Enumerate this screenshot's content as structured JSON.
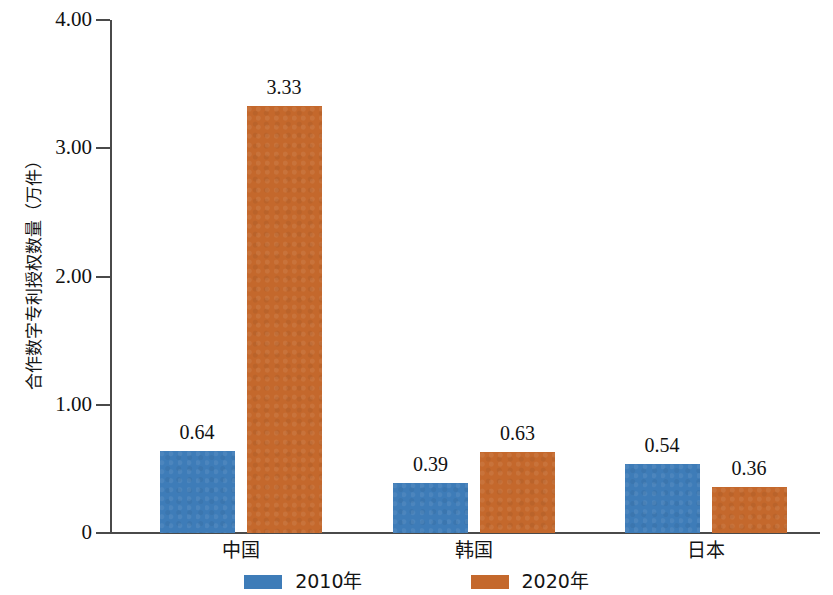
{
  "chart_data": {
    "type": "bar",
    "title": "",
    "subtitle": "",
    "xlabel": "",
    "ylabel": "合作数字专利授权数量（万件）",
    "categories": [
      "中国",
      "韩国",
      "日本"
    ],
    "series": [
      {
        "name": "2010年",
        "color": "#3E7CB8",
        "values": [
          0.64,
          0.39,
          0.54
        ]
      },
      {
        "name": "2020年",
        "color": "#C4682C",
        "values": [
          3.33,
          0.63,
          0.36
        ]
      }
    ],
    "value_labels": [
      [
        "0.64",
        "0.39",
        "0.54"
      ],
      [
        "3.33",
        "0.63",
        "0.36"
      ]
    ],
    "ylim": [
      0,
      4
    ],
    "yticks": [
      0,
      1,
      2,
      3,
      4
    ],
    "ytick_labels": [
      "0",
      "1.00",
      "2.00",
      "3.00",
      "4.00"
    ],
    "grid": false,
    "legend_position": "bottom-center",
    "background_color": "#FFFFFF",
    "axis_color": "#4A4A4A"
  },
  "legend": {
    "items": [
      {
        "label": "2010年",
        "color": "#3E7CB8"
      },
      {
        "label": "2020年",
        "color": "#C4682C"
      }
    ]
  }
}
